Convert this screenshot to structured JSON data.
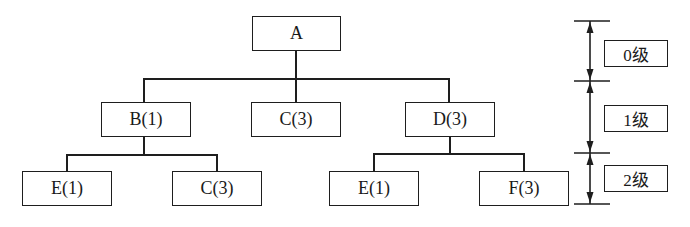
{
  "diagram": {
    "type": "tree-hierarchy",
    "nodes": {
      "root": {
        "label": "A"
      },
      "level1": [
        {
          "label": "B(1)"
        },
        {
          "label": "C(3)"
        },
        {
          "label": "D(3)"
        }
      ],
      "level2": [
        {
          "label": "E(1)",
          "parent": "B(1)"
        },
        {
          "label": "C(3)",
          "parent": "B(1)"
        },
        {
          "label": "E(1)",
          "parent": "D(3)"
        },
        {
          "label": "F(3)",
          "parent": "D(3)"
        }
      ]
    },
    "levels": [
      {
        "label": "0级"
      },
      {
        "label": "1级"
      },
      {
        "label": "2级"
      }
    ],
    "colors": {
      "stroke": "#1e1e1e",
      "background": "#ffffff"
    }
  }
}
